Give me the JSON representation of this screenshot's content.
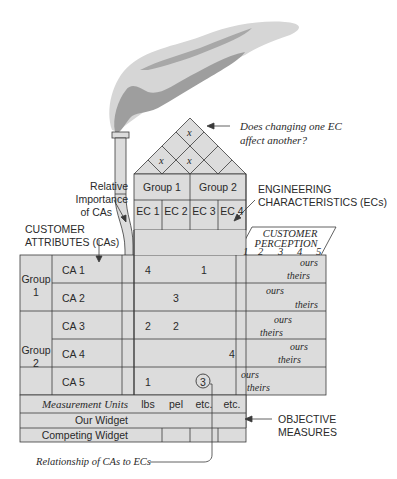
{
  "diagram": {
    "roof": {
      "marks": [
        "x",
        "x",
        "x"
      ],
      "annotation": "Does changing one EC affect another?",
      "annotation_lines": [
        "Does changing one EC",
        "affect another?"
      ]
    },
    "ec_groups": [
      "Group 1",
      "Group 2"
    ],
    "ecs": [
      "EC 1",
      "EC 2",
      "EC 3",
      "EC 4"
    ],
    "labels": {
      "engineering_characteristics": [
        "ENGINEERING",
        "CHARACTERISTICS (ECs)"
      ],
      "customer_attributes": [
        "CUSTOMER",
        "ATTRIBUTES (CAs)"
      ],
      "relative_importance": [
        "Relative",
        "Importance",
        "of CAs"
      ],
      "customer_perception": [
        "CUSTOMER",
        "PERCEPTION"
      ],
      "objective_measures": [
        "OBJECTIVE",
        "MEASURES"
      ],
      "relationship": "Relationship of CAs to ECs"
    },
    "perception_scale": [
      "1",
      "2",
      "3",
      "4",
      "5"
    ],
    "ca_groups": [
      {
        "label_lines": [
          "Group",
          "1"
        ]
      },
      {
        "label_lines": [
          "Group",
          "2"
        ]
      }
    ],
    "rows": [
      {
        "ca": "CA 1",
        "values": [
          "4",
          "",
          "1",
          ""
        ],
        "ours": "ours",
        "theirs": "theirs"
      },
      {
        "ca": "CA 2",
        "values": [
          "",
          "3",
          "",
          ""
        ],
        "ours": "ours",
        "theirs": "theirs"
      },
      {
        "ca": "CA 3",
        "values": [
          "2",
          "2",
          "",
          ""
        ],
        "ours": "ours",
        "theirs": "theirs"
      },
      {
        "ca": "CA 4",
        "values": [
          "",
          "",
          "",
          "4"
        ],
        "ours": "ours",
        "theirs": "theirs"
      },
      {
        "ca": "CA 5",
        "values": [
          "1",
          "",
          "3",
          ""
        ],
        "ours": "ours",
        "theirs": "theirs"
      }
    ],
    "bottom_rows": [
      {
        "label": "Measurement Units",
        "values": [
          "lbs",
          "pel",
          "etc.",
          "etc."
        ]
      },
      {
        "label": "Our Widget",
        "values": [
          "",
          "",
          "",
          ""
        ]
      },
      {
        "label": "Competing Widget",
        "values": [
          "",
          "",
          "",
          ""
        ]
      }
    ],
    "colors": {
      "fill": "#dcdcdc",
      "line": "#3a3a3a",
      "smoke_light": "#d6d6d6",
      "smoke_dark": "#9e9e9e"
    }
  }
}
